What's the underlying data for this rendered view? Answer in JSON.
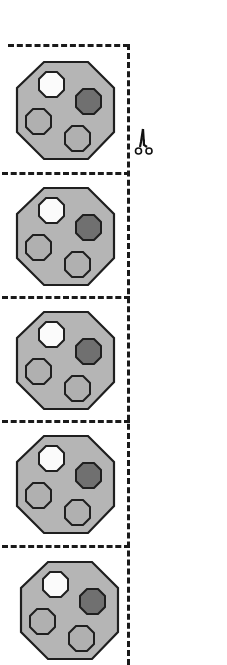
{
  "sheet": {
    "description": "Printable cut-out strip of octagon tokens",
    "card_count": 5,
    "cut_lines_y": [
      44,
      173,
      297,
      421,
      546
    ],
    "card_tops": [
      56,
      182,
      306,
      430,
      556
    ],
    "colors": {
      "outline": "#1f1f1f",
      "octagon_fill": "#b5b5b5",
      "white_gem": "#fbfbfb",
      "dark_gem": "#707070",
      "light_gem": "#b0b0b0",
      "cut_line": "#1a1a1a"
    }
  },
  "cards": [
    {
      "label": "octagon-token-1",
      "gems": [
        "white",
        "dark",
        "light",
        "light"
      ]
    },
    {
      "label": "octagon-token-2",
      "gems": [
        "white",
        "dark",
        "light",
        "light"
      ]
    },
    {
      "label": "octagon-token-3",
      "gems": [
        "white",
        "dark",
        "light",
        "light"
      ]
    },
    {
      "label": "octagon-token-4",
      "gems": [
        "white",
        "dark",
        "light",
        "light"
      ]
    },
    {
      "label": "octagon-token-5",
      "gems": [
        "white",
        "dark",
        "light",
        "light"
      ]
    }
  ],
  "icons": {
    "scissors": "scissors-icon"
  }
}
